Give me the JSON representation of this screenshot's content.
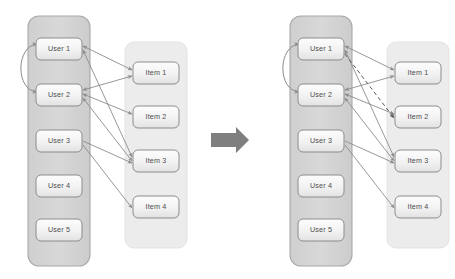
{
  "figure": {
    "title": "",
    "background_color": "#ffffff",
    "panels_count": 2,
    "transition_icon": "right-block-arrow-icon"
  },
  "colors": {
    "user_panel_fill": "#d4d4d4",
    "user_panel_stroke": "#a6a6a6",
    "item_panel_fill": "#ececec",
    "item_panel_stroke": "#e0e0e0",
    "node_fill_top": "#fcfcfc",
    "node_fill_bottom": "#e6e6e6",
    "node_stroke": "#8c8c8c",
    "node_text": "#4d4d4d",
    "edge_stroke": "#8c8c8c",
    "dashed_edge_stroke": "#5a5a5a",
    "block_arrow_fill": "#7f7f7f"
  },
  "left_diagram": {
    "name": "before-state",
    "user_panel": {
      "label": "user-group-panel",
      "nodes": [
        {
          "id": "u1",
          "label": "User 1"
        },
        {
          "id": "u2",
          "label": "User 2"
        },
        {
          "id": "u3",
          "label": "User 3"
        },
        {
          "id": "u4",
          "label": "User 4"
        },
        {
          "id": "u5",
          "label": "User 5"
        }
      ]
    },
    "item_panel": {
      "label": "item-group-panel",
      "nodes": [
        {
          "id": "i1",
          "label": "Item 1"
        },
        {
          "id": "i2",
          "label": "Item 2"
        },
        {
          "id": "i3",
          "label": "Item 3"
        },
        {
          "id": "i4",
          "label": "Item 4"
        }
      ]
    },
    "social_edges": [
      {
        "from": "u1",
        "to": "u2",
        "style": "solid",
        "arrows": "both"
      }
    ],
    "interaction_edges": [
      {
        "from": "u1",
        "to": "i1",
        "style": "solid",
        "arrows": "both"
      },
      {
        "from": "u1",
        "to": "i3",
        "style": "solid",
        "arrows": "both"
      },
      {
        "from": "u2",
        "to": "i1",
        "style": "solid",
        "arrows": "both"
      },
      {
        "from": "u2",
        "to": "i2",
        "style": "solid",
        "arrows": "both"
      },
      {
        "from": "u2",
        "to": "i3",
        "style": "solid",
        "arrows": "both"
      },
      {
        "from": "u3",
        "to": "i3",
        "style": "solid",
        "arrows": "forward"
      },
      {
        "from": "u3",
        "to": "i4",
        "style": "solid",
        "arrows": "forward"
      }
    ]
  },
  "right_diagram": {
    "name": "after-state",
    "user_panel": {
      "label": "user-group-panel",
      "nodes": [
        {
          "id": "u1",
          "label": "User 1"
        },
        {
          "id": "u2",
          "label": "User 2"
        },
        {
          "id": "u3",
          "label": "User 3"
        },
        {
          "id": "u4",
          "label": "User 4"
        },
        {
          "id": "u5",
          "label": "User 5"
        }
      ]
    },
    "item_panel": {
      "label": "item-group-panel",
      "nodes": [
        {
          "id": "i1",
          "label": "Item 1"
        },
        {
          "id": "i2",
          "label": "Item 2"
        },
        {
          "id": "i3",
          "label": "Item 3"
        },
        {
          "id": "i4",
          "label": "Item 4"
        }
      ]
    },
    "social_edges": [
      {
        "from": "u1",
        "to": "u2",
        "style": "solid",
        "arrows": "both"
      }
    ],
    "interaction_edges": [
      {
        "from": "u1",
        "to": "i1",
        "style": "solid",
        "arrows": "both"
      },
      {
        "from": "u1",
        "to": "i3",
        "style": "solid",
        "arrows": "both"
      },
      {
        "from": "u2",
        "to": "i1",
        "style": "solid",
        "arrows": "both"
      },
      {
        "from": "u2",
        "to": "i2",
        "style": "solid",
        "arrows": "both"
      },
      {
        "from": "u2",
        "to": "i3",
        "style": "solid",
        "arrows": "both"
      },
      {
        "from": "u3",
        "to": "i3",
        "style": "solid",
        "arrows": "forward"
      },
      {
        "from": "u3",
        "to": "i4",
        "style": "solid",
        "arrows": "forward"
      }
    ],
    "predicted_edges": [
      {
        "from": "u1",
        "to": "i2",
        "style": "dashed",
        "arrows": "forward"
      }
    ]
  },
  "geometry": {
    "left_offset": 0,
    "right_offset": 262,
    "user_panel": {
      "x": 28,
      "y": 16,
      "w": 62,
      "h": 250,
      "rx": 11
    },
    "item_panel": {
      "x": 125,
      "y": 42,
      "w": 62,
      "h": 206,
      "rx": 9
    },
    "user_nodes_y": [
      38,
      84,
      130,
      175,
      219
    ],
    "item_nodes_y": [
      62,
      106,
      150,
      196
    ],
    "user_node": {
      "x": 36,
      "w": 46,
      "h": 22,
      "rx": 5
    },
    "item_node": {
      "x": 133,
      "w": 46,
      "h": 22,
      "rx": 5
    },
    "block_arrow": {
      "x": 211,
      "y": 127,
      "w": 38,
      "h": 26
    }
  }
}
